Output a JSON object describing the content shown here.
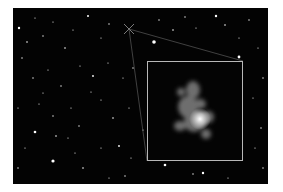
{
  "image": {
    "subject": "deep-field star field with zoomed inset of a distant galaxy",
    "background_color": "#030303",
    "inset_border_color": "#b8b8b8",
    "marker": {
      "icon": "crosshair-x-marker-icon",
      "x": 116,
      "y": 21
    },
    "inset": {
      "x": 134,
      "y": 53,
      "width": 96,
      "height": 100
    }
  }
}
